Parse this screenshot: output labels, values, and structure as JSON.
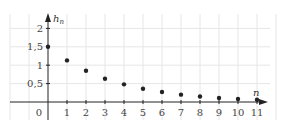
{
  "chart_data": {
    "type": "scatter",
    "title": "",
    "xlabel": "n",
    "ylabel": "h_n",
    "origin_label": "0",
    "x_ticks": [
      "1",
      "2",
      "3",
      "4",
      "5",
      "6",
      "7",
      "8",
      "9",
      "10",
      "11"
    ],
    "y_ticks": [
      "0,5",
      "1",
      "1,5",
      "2"
    ],
    "xlim": [
      -2.5,
      12.5
    ],
    "ylim": [
      -0.5,
      2.5
    ],
    "grid": true,
    "series": [
      {
        "name": "h_n",
        "x": [
          0,
          1,
          2,
          3,
          4,
          5,
          6,
          7,
          8,
          9,
          10,
          11
        ],
        "y": [
          1.5,
          1.13,
          0.85,
          0.63,
          0.48,
          0.36,
          0.27,
          0.2,
          0.15,
          0.11,
          0.08,
          0.06
        ]
      }
    ]
  },
  "colors": {
    "axis": "#222222",
    "grid": "#e6e6e6",
    "point": "#222222"
  }
}
